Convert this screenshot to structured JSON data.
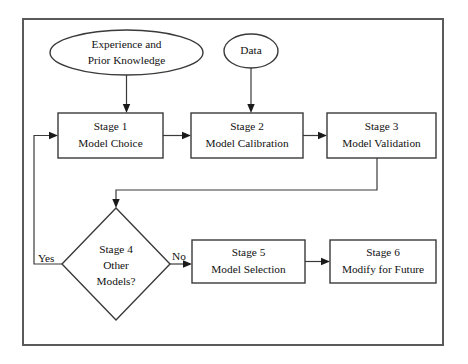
{
  "diagram": {
    "frame": {
      "name": "outer-border"
    },
    "colors": {
      "background": "#ffffff",
      "shape_stroke": "#3a3a3a",
      "frame_stroke": "#5a5a5a",
      "text": "#111111",
      "arrow": "#1a1a1a"
    },
    "nodes": [
      {
        "id": "experience",
        "shape": "ellipse",
        "lines": [
          "Experience and",
          "Prior Knowledge"
        ],
        "line1": "Experience and",
        "line2": "Prior Knowledge",
        "cx": 126.5,
        "cy": 52.5,
        "rx": 76.5,
        "ry": 22.5
      },
      {
        "id": "data",
        "shape": "ellipse",
        "lines": [
          "Data"
        ],
        "line1": "Data",
        "line2": "",
        "cx": 251,
        "cy": 51,
        "rx": 27,
        "ry": 17
      },
      {
        "id": "stage1",
        "shape": "rect",
        "lines": [
          "Stage 1",
          "Model Choice"
        ],
        "line1": "Stage 1",
        "line2": "Model Choice",
        "x": 58,
        "y": 113,
        "w": 105,
        "h": 45
      },
      {
        "id": "stage2",
        "shape": "rect",
        "lines": [
          "Stage 2",
          "Model Calibration"
        ],
        "line1": "Stage 2",
        "line2": "Model Calibration",
        "x": 191,
        "y": 113,
        "w": 112,
        "h": 45
      },
      {
        "id": "stage3",
        "shape": "rect",
        "lines": [
          "Stage 3",
          "Model Validation"
        ],
        "line1": "Stage 3",
        "line2": "Model Validation",
        "x": 327,
        "y": 113,
        "w": 109,
        "h": 45
      },
      {
        "id": "stage4",
        "shape": "diamond",
        "lines": [
          "Stage 4",
          "Other",
          "Models?"
        ],
        "line1": "Stage 4",
        "line2": "Other",
        "line3": "Models?",
        "cx": 116,
        "cy": 264,
        "rx": 54,
        "ry": 56
      },
      {
        "id": "stage5",
        "shape": "rect",
        "lines": [
          "Stage 5",
          "Model Selection"
        ],
        "line1": "Stage 5",
        "line2": "Model Selection",
        "x": 192,
        "y": 240,
        "w": 113,
        "h": 43
      },
      {
        "id": "stage6",
        "shape": "rect",
        "lines": [
          "Stage 6",
          "Modify for Future"
        ],
        "line1": "Stage 6",
        "line2": "Modify for Future",
        "x": 330,
        "y": 240,
        "w": 106,
        "h": 43
      }
    ],
    "edges": [
      {
        "id": "experience-to-stage1",
        "from": "experience",
        "to": "stage1",
        "label": ""
      },
      {
        "id": "data-to-stage2",
        "from": "data",
        "to": "stage2",
        "label": ""
      },
      {
        "id": "stage1-to-stage2",
        "from": "stage1",
        "to": "stage2",
        "label": ""
      },
      {
        "id": "stage2-to-stage3",
        "from": "stage2",
        "to": "stage3",
        "label": ""
      },
      {
        "id": "stage3-to-stage4",
        "from": "stage3",
        "to": "stage4",
        "label": ""
      },
      {
        "id": "stage4-yes-to-stage1",
        "from": "stage4",
        "to": "stage1",
        "label": "Yes"
      },
      {
        "id": "stage4-no-to-stage5",
        "from": "stage4",
        "to": "stage5",
        "label": "No"
      },
      {
        "id": "stage5-to-stage6",
        "from": "stage5",
        "to": "stage6",
        "label": ""
      }
    ],
    "edge_labels": {
      "yes": "Yes",
      "no": "No"
    }
  }
}
